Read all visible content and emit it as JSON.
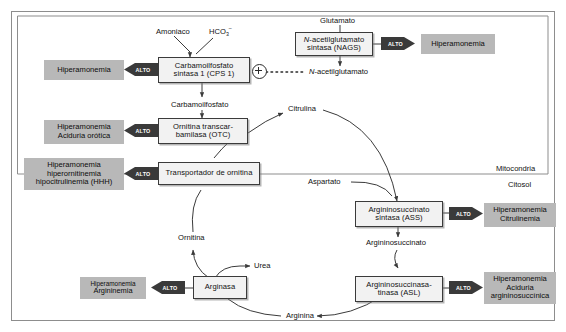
{
  "figure": {
    "colors": {
      "disease_fill": "#b8b8b8",
      "enzyme_fill": "#f2f2f2",
      "stroke": "#3b3b3b",
      "alto_fill": "#3a3a3a",
      "alto_text": "#ffffff",
      "background": "#ffffff"
    }
  },
  "compartments": {
    "mitochondria_label": "Mitocondria",
    "cytosol_label": "Citosol"
  },
  "alto_label": "ALTO",
  "enzymes": [
    {
      "id": "cps1",
      "lines": [
        "Carbamoilfosfato",
        "sintasa 1 (CPS 1)"
      ]
    },
    {
      "id": "nags",
      "lines": [
        "N-acetilglutamato",
        "sintasa (NAGS)"
      ],
      "italic_prefix": "N"
    },
    {
      "id": "otc",
      "lines": [
        "Ornitina transcar-",
        "bamilasa (OTC)"
      ]
    },
    {
      "id": "transporter",
      "lines": [
        "Transportador de ornitina"
      ]
    },
    {
      "id": "ass",
      "lines": [
        "Argininosuccinato",
        "sintasa (ASS)"
      ]
    },
    {
      "id": "asl",
      "lines": [
        "Argininosuccinasa-",
        "tinasa (ASL)"
      ]
    },
    {
      "id": "arginase",
      "lines": [
        "Arginasa"
      ]
    }
  ],
  "diseases": [
    {
      "id": "hiperamonemia_cps1",
      "lines": [
        "Hiperamonemia"
      ]
    },
    {
      "id": "hiperamonemia_nags",
      "lines": [
        "Hiperamonemia"
      ]
    },
    {
      "id": "aciduria_orotica",
      "lines": [
        "Hiperamonemia",
        "Aciduria orótica"
      ]
    },
    {
      "id": "hhh",
      "lines": [
        "Hiperamonemia",
        "hiperornitinemia",
        "hipocitrulinemia (HHH)"
      ]
    },
    {
      "id": "citrulinemia",
      "lines": [
        "Hiperamonemia",
        "Citrulinemia"
      ]
    },
    {
      "id": "aciduria_argsucc",
      "lines": [
        "Hiperamonemia",
        "Aciduria",
        "argininosuccínica"
      ]
    },
    {
      "id": "argininemia",
      "lines": [
        "Hiperamonemia",
        "Argininemia"
      ]
    }
  ],
  "metabolites": {
    "amoniaco": "Amoniaco",
    "bicarbonato_base": "HCO",
    "bicarbonato_sub": "3",
    "bicarbonato_sup": "–",
    "glutamato": "Glutamato",
    "n_acetilglutamato_italic": "N",
    "n_acetilglutamato_rest": "-acetilglutamato",
    "carbamoilfosfato": "Carbamoilfosfato",
    "citrulina": "Citrulina",
    "aspartato": "Aspartato",
    "argininosuccinato": "Argininosuccinato",
    "arginina": "Arginina",
    "ornitina": "Ornitina",
    "urea": "Urea"
  }
}
